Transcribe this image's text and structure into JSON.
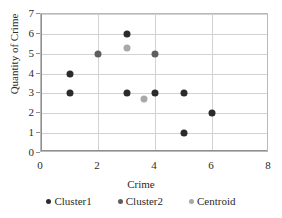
{
  "chart_data": {
    "type": "scatter",
    "title": "",
    "xlabel": "Crime",
    "ylabel": "Quantity of Crime",
    "xlim": [
      0,
      8
    ],
    "ylim": [
      0,
      7
    ],
    "xticks": [
      0,
      2,
      4,
      6,
      8
    ],
    "yticks": [
      0,
      1,
      2,
      3,
      4,
      5,
      6,
      7
    ],
    "grid": true,
    "legend_position": "bottom",
    "series": [
      {
        "name": "Cluster1",
        "color": "#2b2b2b",
        "points": [
          {
            "x": 1,
            "y": 4
          },
          {
            "x": 1,
            "y": 3
          },
          {
            "x": 3,
            "y": 6
          },
          {
            "x": 3,
            "y": 3
          },
          {
            "x": 4,
            "y": 3
          },
          {
            "x": 5,
            "y": 3
          },
          {
            "x": 5,
            "y": 1
          },
          {
            "x": 6,
            "y": 2
          }
        ]
      },
      {
        "name": "Cluster2",
        "color": "#5e5e5e",
        "points": [
          {
            "x": 2,
            "y": 5
          },
          {
            "x": 4,
            "y": 5
          }
        ]
      },
      {
        "name": "Centroid",
        "color": "#a8a8a8",
        "points": [
          {
            "x": 3,
            "y": 5.3
          },
          {
            "x": 3.6,
            "y": 2.7
          }
        ]
      }
    ]
  },
  "legend": {
    "items": [
      {
        "label": "Cluster1",
        "color": "#2b2b2b"
      },
      {
        "label": "Cluster2",
        "color": "#5e5e5e"
      },
      {
        "label": "Centroid",
        "color": "#a8a8a8"
      }
    ]
  }
}
